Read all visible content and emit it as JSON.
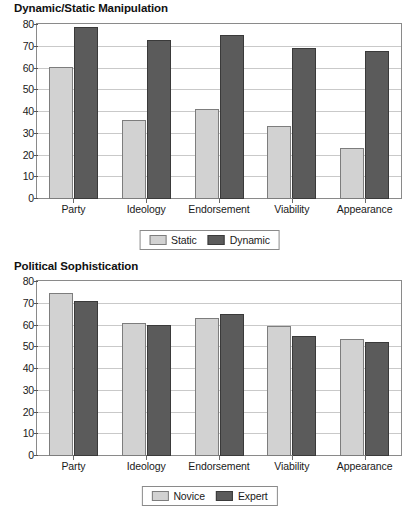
{
  "chart_data": [
    {
      "type": "bar",
      "title": "Dynamic/Static Manipulation",
      "xlabel": "",
      "ylabel": "",
      "ylim": [
        0,
        80
      ],
      "ytick_step": 10,
      "yticks": [
        "0",
        "10",
        "20",
        "30",
        "40",
        "50",
        "60",
        "70",
        "80"
      ],
      "grid": true,
      "legend_position": "bottom-center",
      "categories": [
        "Party",
        "Ideology",
        "Endorsement",
        "Viability",
        "Appearance"
      ],
      "series": [
        {
          "name": "Static",
          "color": "#d2d2d2",
          "values": [
            60.5,
            36,
            41,
            33.5,
            23.5
          ]
        },
        {
          "name": "Dynamic",
          "color": "#5b5b5b",
          "values": [
            78.5,
            72.5,
            75,
            69,
            67.5
          ]
        }
      ]
    },
    {
      "type": "bar",
      "title": "Political Sophistication",
      "xlabel": "",
      "ylabel": "",
      "ylim": [
        0,
        80
      ],
      "ytick_step": 10,
      "yticks": [
        "0",
        "10",
        "20",
        "30",
        "40",
        "50",
        "60",
        "70",
        "80"
      ],
      "grid": true,
      "legend_position": "bottom-center",
      "categories": [
        "Party",
        "Ideology",
        "Endorsement",
        "Viability",
        "Appearance"
      ],
      "series": [
        {
          "name": "Novice",
          "color": "#d2d2d2",
          "values": [
            74.5,
            61,
            63,
            59.5,
            53.5
          ]
        },
        {
          "name": "Expert",
          "color": "#5b5b5b",
          "values": [
            71,
            60,
            65,
            55,
            52
          ]
        }
      ]
    }
  ]
}
